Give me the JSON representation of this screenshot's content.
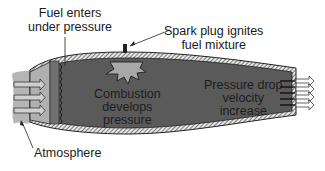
{
  "diagram": {
    "labels": {
      "fuel_line1": "Fuel enters",
      "fuel_line2": "under pressure",
      "spark_line1": "Spark plug ignites",
      "spark_line2": "fuel mixture",
      "combustion_line1": "Combustion",
      "combustion_line2": "develops",
      "combustion_line3": "pressure",
      "exit_line1": "Pressure drop",
      "exit_line2": "velocity",
      "exit_line3": "increase",
      "atmosphere": "Atmosphere"
    },
    "colors": {
      "chamber": "#5a5a5a",
      "inlet_air": "#b0b0b0",
      "wall": "#d8d8d8",
      "burst": "#a8a8a8",
      "text": "#1a1a1a"
    }
  }
}
